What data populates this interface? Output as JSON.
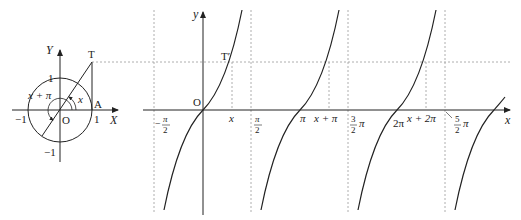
{
  "unit_circle": {
    "axis_x_label": "X",
    "axis_y_label": "Y",
    "tick_1_y": "1",
    "tick_neg1_y": "−1",
    "tick_1_x": "1",
    "tick_neg1_x": "−1",
    "origin": "O",
    "point_A": "A",
    "point_T": "T",
    "angle_x": "x",
    "angle_x_plus_pi": "x + π"
  },
  "graph": {
    "axis_x_label": "x",
    "axis_y_label": "y",
    "origin": "O",
    "point_T_prime": "T′",
    "labels": {
      "neg_half_pi_num": "π",
      "neg_half_pi_den": "2",
      "neg_sign": "−",
      "half_pi_num": "π",
      "half_pi_den": "2",
      "x": "x",
      "pi": "π",
      "x_plus_pi": "x + π",
      "three_half_pi_num": "3",
      "three_half_pi_den": "2",
      "three_half_pi_suffix": "π",
      "two_pi": "2π",
      "x_plus_2pi": "x + 2π",
      "five_half_pi_num": "5",
      "five_half_pi_den": "2",
      "five_half_pi_suffix": "π"
    }
  }
}
